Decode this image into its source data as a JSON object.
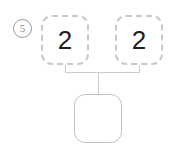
{
  "problem": {
    "number_label": "⑤",
    "number_value": "5",
    "type": "number-bond-addition"
  },
  "addends": [
    {
      "label": "2",
      "border_style": "dashed",
      "filled": true
    },
    {
      "label": "2",
      "border_style": "dashed",
      "filled": true
    }
  ],
  "sum": {
    "label": "",
    "border_style": "solid",
    "filled": false
  },
  "colors": {
    "background": "#ffffff",
    "dashed_border": "#c9c9c9",
    "solid_border": "#c2c2c2",
    "connector_line": "#cccccc",
    "digit_text": "#231f20",
    "problem_number_text": "#8e8e8e"
  }
}
